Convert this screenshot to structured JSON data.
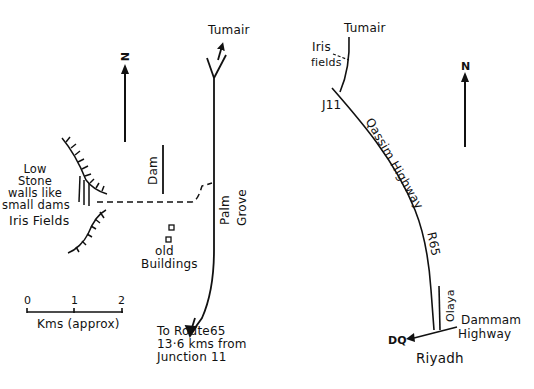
{
  "left_map": {
    "title": "Iris Fields detail map",
    "north_label": "N",
    "destination_top": "Tumair",
    "labels": {
      "low_stone_line1": "Low",
      "low_stone_line2": "Stone",
      "low_stone_line3": "walls like",
      "low_stone_line4": "small dams",
      "iris_fields": "Iris Fields",
      "dam": "Dam",
      "palm": "Palm",
      "grove": "Grove",
      "old": "old",
      "buildings": "Buildings"
    },
    "bottom_note": {
      "line1": "To Route65",
      "line2": "13·6 kms from",
      "line3": "Junction 11"
    },
    "scale_bar": {
      "ticks": [
        "0",
        "1",
        "2"
      ],
      "unit_label": "Kms (approx)"
    }
  },
  "right_map": {
    "title": "Route overview map",
    "north_label": "N",
    "labels": {
      "tumair": "Tumair",
      "iris": "Iris",
      "fields": "fields",
      "junction": "J11",
      "highway": "Qassim Highway",
      "route": "R65",
      "olaya": "Olaya",
      "dammam": "Dammam",
      "highway2": "Highway",
      "dq": "DQ",
      "riyadh": "Riyadh"
    }
  },
  "colors": {
    "ink": "#111111",
    "paper": "#ffffff"
  }
}
